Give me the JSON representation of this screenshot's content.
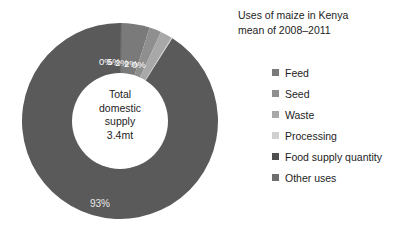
{
  "chart_data": {
    "type": "pie",
    "variant": "donut",
    "title": "Uses  of maize in Kenya",
    "subtitle": "mean of 2008–2011",
    "categories": [
      "Feed",
      "Seed",
      "Waste",
      "Processing",
      "Food supply quantity",
      "Other uses"
    ],
    "values": [
      5,
      2,
      2,
      0,
      93,
      0
    ],
    "data_labels": [
      "5%",
      "2%",
      "2%",
      "0%",
      "93%",
      "0%"
    ],
    "colors": [
      "#7a7a7a",
      "#8f8f8f",
      "#a8a8a8",
      "#d0d0d0",
      "#5a5a5a",
      "#6e6e6e"
    ],
    "unit": "%",
    "legend_position": "right",
    "grid": false,
    "center_label": {
      "line1": "Total",
      "line2": "domestic",
      "line3": "supply",
      "line4": "3.4mt"
    },
    "label_cluster": [
      "0%",
      "5%",
      "2%",
      "2%",
      "0%"
    ],
    "major_label": "93%"
  },
  "title": {
    "line1": "Uses  of maize in Kenya",
    "line2": "mean of 2008–2011"
  },
  "legend": {
    "items": [
      {
        "label": "Feed",
        "color": "#7a7a7a"
      },
      {
        "label": "Seed",
        "color": "#8f8f8f"
      },
      {
        "label": "Waste",
        "color": "#a8a8a8"
      },
      {
        "label": "Processing",
        "color": "#d0d0d0"
      },
      {
        "label": "Food supply quantity",
        "color": "#4f4f4f"
      },
      {
        "label": "Other uses",
        "color": "#6e6e6e"
      }
    ]
  }
}
